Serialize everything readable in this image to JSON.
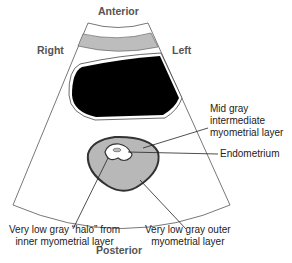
{
  "orientation": {
    "top": "Anterior",
    "bottom": "Posterior",
    "left": "Right",
    "right": "Left"
  },
  "labels": {
    "intermediate": [
      "Mid gray",
      "intermediate",
      "myometrial layer"
    ],
    "endometrium": "Endometrium",
    "halo": [
      "Very low gray “halo” from",
      "inner myometrial layer"
    ],
    "outer": [
      "Very low gray outer",
      "myometrial layer"
    ]
  },
  "colors": {
    "bladder": "#000000",
    "mid_gray": "#b8b8b8",
    "outline": "#444444"
  }
}
